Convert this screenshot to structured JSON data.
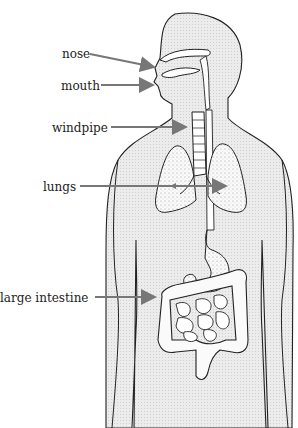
{
  "diagram": {
    "title": "",
    "colors": {
      "body_fill": "#e6e6e6",
      "outline": "#222222",
      "arrow": "#777777",
      "organ_fill": "#ffffff",
      "background": "#ffffff"
    },
    "labels": [
      {
        "id": "nose",
        "text": "nose",
        "x": 62,
        "y": 47,
        "arrow_from": [
          90,
          54
        ],
        "arrow_to": [
          156,
          67
        ]
      },
      {
        "id": "mouth",
        "text": "mouth",
        "x": 61,
        "y": 79,
        "arrow_from": [
          101,
          85
        ],
        "arrow_to": [
          155,
          85
        ]
      },
      {
        "id": "windpipe",
        "text": "windpipe",
        "x": 52,
        "y": 121,
        "arrow_from": [
          111,
          127
        ],
        "arrow_to": [
          188,
          127
        ]
      },
      {
        "id": "lungs",
        "text": "lungs",
        "x": 43,
        "y": 180,
        "arrow_from": [
          80,
          186
        ],
        "arrow_to": [
          228,
          186
        ]
      },
      {
        "id": "large-intestine",
        "text": "large intestine",
        "x": 0,
        "y": 291,
        "arrow_from": [
          95,
          297
        ],
        "arrow_to": [
          157,
          297
        ]
      }
    ]
  }
}
